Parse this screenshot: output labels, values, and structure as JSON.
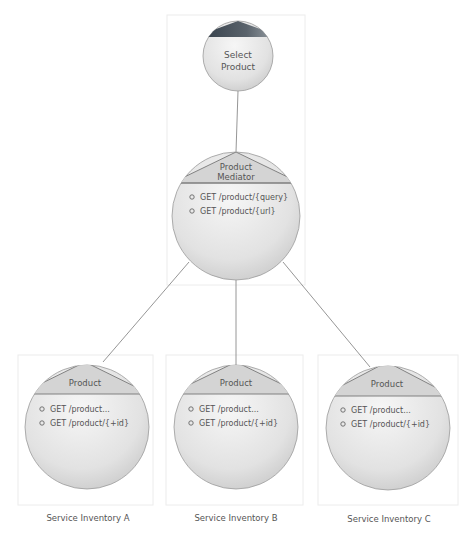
{
  "diagram": {
    "top_node": {
      "label_lines": [
        "Select",
        "Product"
      ]
    },
    "mediator": {
      "title_lines": [
        "Product",
        "Mediator"
      ],
      "operations": [
        "GET /product/{query}",
        "GET /product/{url}"
      ]
    },
    "services": [
      {
        "title": "Product",
        "operations": [
          "GET /product...",
          "GET /product/{+id}"
        ],
        "inventory_label": "Service Inventory A"
      },
      {
        "title": "Product",
        "operations": [
          "GET /product...",
          "GET /product/{+id}"
        ],
        "inventory_label": "Service Inventory B"
      },
      {
        "title": "Product",
        "operations": [
          "GET /product...",
          "GET /product/{+id}"
        ],
        "inventory_label": "Service Inventory C"
      }
    ],
    "colors": {
      "circle_fill_light": "#f2f2f2",
      "circle_fill_dark": "#cfcfcf",
      "top_triangle_dark": "#3f4a55"
    }
  }
}
